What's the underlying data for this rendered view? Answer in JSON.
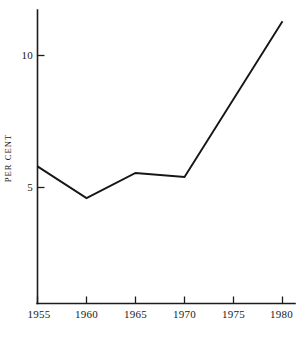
{
  "chart_data": {
    "type": "line",
    "title": "",
    "subtitle": "",
    "xlabel": "",
    "ylabel": "PER CENT",
    "x": [
      1955,
      1960,
      1965,
      1970,
      1980
    ],
    "values": [
      5.8,
      4.6,
      5.55,
      5.4,
      11.3
    ],
    "series": [
      {
        "name": "per cent",
        "x": [
          1955,
          1960,
          1965,
          1970,
          1980
        ],
        "values": [
          5.8,
          4.6,
          5.55,
          5.4,
          11.3
        ]
      }
    ],
    "xlim": [
      1955,
      1981
    ],
    "ylim": [
      0,
      11.8
    ],
    "x_tick_labels": [
      "1955",
      "1960",
      "1965",
      "1970",
      "1975",
      "1980"
    ],
    "x_tick_values": [
      1955,
      1960,
      1965,
      1970,
      1975,
      1980
    ],
    "y_tick_labels": [
      "5",
      "10"
    ],
    "y_tick_values": [
      5,
      10
    ],
    "grid": false,
    "legend": false,
    "legend_position": "none",
    "line_color": "#161616",
    "axis_color": "#1c1c1c",
    "background_color": "#ffffff",
    "annotations": []
  },
  "axes": {
    "y_title": "PER CENT"
  }
}
